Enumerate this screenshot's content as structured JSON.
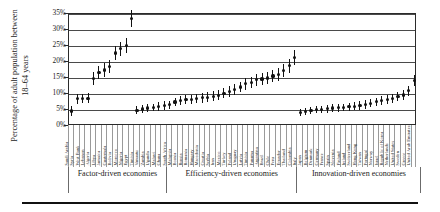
{
  "chart_data": {
    "type": "scatter",
    "title": "",
    "xlabel": "",
    "ylabel": "Percentage of adult population between 18–64 years",
    "ylabel_line1": "Percentage of adult population between",
    "ylabel_line2": "18–64 years",
    "ylim": [
      0,
      35
    ],
    "ytick_labels": [
      "0%",
      "5%",
      "10%",
      "15%",
      "20%",
      "25%",
      "30%",
      "35%"
    ],
    "ytick_values": [
      0,
      5,
      10,
      15,
      20,
      25,
      30,
      35
    ],
    "grid": true,
    "legend": "none",
    "marker": "point-with-error-bar",
    "series_name": "Total early-stage entrepreneurial activity",
    "groups": [
      {
        "label": "Factor-driven economies",
        "count": 18
      },
      {
        "label": "Efficiency-driven economies",
        "count": 24
      },
      {
        "label": "Innovation-driven economies",
        "count": 23
      }
    ],
    "categories": [
      "Saudi Arabia",
      "Syria",
      "West Bank",
      "Lebanon",
      "Algeria",
      "Libya",
      "Jamaica",
      "Guatemala",
      "Bolivia",
      "Morocco",
      "Nigeria",
      "Egypt",
      "Tunisia",
      "Vanuatu",
      "Zambia",
      "Uganda",
      "Malawi",
      "Ghana",
      "South Africa",
      "Malaysia",
      "Bosnia",
      "Russia",
      "Romania",
      "Hungary",
      "Macedonia",
      "Croatia",
      "Serbia",
      "Iran",
      "Mexico",
      "Turkey",
      "Poland",
      "Uruguay",
      "Latvia",
      "Tunisia",
      "Panama",
      "Argentina",
      "Brazil",
      "Chile",
      "Peru",
      "Ecuador",
      "Thailand",
      "Colombia",
      "Italy",
      "Japan",
      "Belgium",
      "Denmark",
      "Germany",
      "France",
      "Spain",
      "Slovenia",
      "Finland",
      "Ireland",
      "Switzerland",
      "Hong Kong",
      "Taiwan",
      "Portugal",
      "Norway",
      "Israel",
      "Republic of Korea",
      "Netherlands",
      "United States",
      "Sweden",
      "Greece",
      "United Arab Emirates"
    ],
    "values": [
      4.7,
      8.5,
      8.6,
      8.7,
      14.9,
      16.8,
      17.5,
      18.6,
      22.8,
      24.2,
      25.2,
      33.6,
      4.9,
      5.3,
      5.6,
      5.8,
      6.1,
      6.4,
      6.6,
      7.5,
      8.0,
      8.2,
      8.4,
      8.6,
      8.8,
      9.0,
      9.3,
      9.6,
      10.2,
      10.8,
      11.4,
      12.2,
      13.2,
      13.6,
      14.5,
      14.7,
      15.0,
      15.6,
      16.2,
      17.4,
      18.8,
      21.4,
      4.3,
      4.6,
      4.9,
      5.1,
      5.2,
      5.4,
      5.6,
      5.7,
      5.8,
      6.0,
      6.2,
      6.4,
      6.7,
      7.1,
      7.6,
      7.9,
      8.2,
      8.6,
      9.2,
      9.7,
      11.0,
      14.2
    ],
    "error_bars": [
      1.6,
      1.5,
      1.5,
      1.5,
      2.0,
      2.0,
      2.1,
      2.1,
      2.3,
      2.2,
      2.3,
      2.6,
      1.2,
      1.2,
      1.2,
      1.2,
      1.3,
      1.3,
      1.3,
      1.4,
      1.4,
      1.4,
      1.4,
      1.5,
      1.5,
      1.5,
      1.5,
      1.5,
      1.6,
      1.6,
      1.7,
      1.7,
      1.8,
      1.8,
      1.9,
      1.9,
      1.9,
      2.0,
      2.0,
      2.1,
      2.1,
      2.3,
      1.1,
      1.1,
      1.1,
      1.1,
      1.1,
      1.2,
      1.2,
      1.2,
      1.2,
      1.2,
      1.2,
      1.3,
      1.3,
      1.3,
      1.3,
      1.4,
      1.4,
      1.4,
      1.5,
      1.5,
      1.6,
      1.8
    ],
    "colors": {
      "marker": "#111111",
      "grid": "#4a4a4a",
      "frame": "#2b2b2b",
      "text": "#1a1a1a"
    }
  }
}
